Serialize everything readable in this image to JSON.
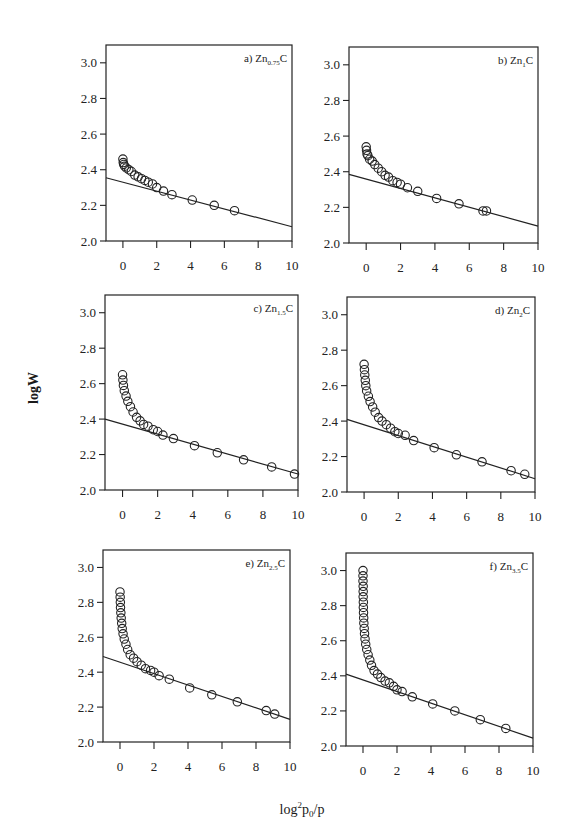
{
  "figure": {
    "ylabel": "logW",
    "xlabel_parts": {
      "base": "log",
      "sup": "2",
      "p": "p",
      "sub": "0",
      "tail": "/p"
    }
  },
  "chart_data": [
    {
      "type": "scatter",
      "id": "a",
      "title": "a) Zn0.75C",
      "label_prefix": "a) Zn",
      "label_sub": "0.75",
      "label_suffix": "C",
      "xlabel": "log²p0/p",
      "ylabel": "logW",
      "xlim": [
        -1,
        10
      ],
      "ylim": [
        2.0,
        3.1
      ],
      "xticks": [
        0,
        2,
        4,
        6,
        8,
        10
      ],
      "yticks": [
        2.0,
        2.2,
        2.4,
        2.6,
        2.8,
        3.0
      ],
      "grid": false,
      "box": {
        "x": 106,
        "y": 45,
        "w": 186,
        "h": 196
      },
      "points": [
        [
          0.0,
          2.46
        ],
        [
          0.02,
          2.44
        ],
        [
          0.05,
          2.43
        ],
        [
          0.1,
          2.42
        ],
        [
          0.2,
          2.41
        ],
        [
          0.35,
          2.4
        ],
        [
          0.5,
          2.39
        ],
        [
          0.7,
          2.37
        ],
        [
          0.9,
          2.36
        ],
        [
          1.1,
          2.35
        ],
        [
          1.3,
          2.34
        ],
        [
          1.5,
          2.33
        ],
        [
          1.75,
          2.32
        ],
        [
          2.0,
          2.3
        ],
        [
          2.4,
          2.28
        ],
        [
          2.9,
          2.26
        ],
        [
          4.1,
          2.23
        ],
        [
          5.4,
          2.2
        ],
        [
          6.6,
          2.17
        ]
      ],
      "fit_line": {
        "x": [
          -1,
          10
        ],
        "y": [
          2.355,
          2.08
        ]
      }
    },
    {
      "type": "scatter",
      "id": "b",
      "title": "b) Zn1C",
      "label_prefix": "b) Zn",
      "label_sub": "1",
      "label_suffix": "C",
      "xlabel": "log²p0/p",
      "ylabel": "logW",
      "xlim": [
        -1,
        10
      ],
      "ylim": [
        2.0,
        3.1
      ],
      "xticks": [
        0,
        2,
        4,
        6,
        8,
        10
      ],
      "yticks": [
        2.0,
        2.2,
        2.4,
        2.6,
        2.8,
        3.0
      ],
      "grid": false,
      "box": {
        "x": 349,
        "y": 47,
        "w": 189,
        "h": 196
      },
      "points": [
        [
          0.0,
          2.54
        ],
        [
          0.02,
          2.52
        ],
        [
          0.05,
          2.5
        ],
        [
          0.1,
          2.49
        ],
        [
          0.2,
          2.47
        ],
        [
          0.35,
          2.46
        ],
        [
          0.5,
          2.44
        ],
        [
          0.7,
          2.42
        ],
        [
          0.9,
          2.4
        ],
        [
          1.1,
          2.38
        ],
        [
          1.3,
          2.37
        ],
        [
          1.55,
          2.35
        ],
        [
          1.8,
          2.34
        ],
        [
          2.0,
          2.33
        ],
        [
          2.4,
          2.31
        ],
        [
          3.0,
          2.29
        ],
        [
          4.1,
          2.25
        ],
        [
          5.4,
          2.22
        ],
        [
          6.8,
          2.18
        ],
        [
          7.0,
          2.18
        ]
      ],
      "fit_line": {
        "x": [
          -1,
          10
        ],
        "y": [
          2.385,
          2.095
        ]
      }
    },
    {
      "type": "scatter",
      "id": "c",
      "title": "c) Zn1.5C",
      "label_prefix": "c) Zn",
      "label_sub": "1.5",
      "label_suffix": "C",
      "xlabel": "log²p0/p",
      "ylabel": "logW",
      "xlim": [
        -1,
        10
      ],
      "ylim": [
        2.0,
        3.1
      ],
      "xticks": [
        0,
        2,
        4,
        6,
        8,
        10
      ],
      "yticks": [
        2.0,
        2.2,
        2.4,
        2.6,
        2.8,
        3.0
      ],
      "grid": false,
      "box": {
        "x": 105,
        "y": 295,
        "w": 193,
        "h": 195
      },
      "points": [
        [
          0.0,
          2.65
        ],
        [
          0.02,
          2.62
        ],
        [
          0.05,
          2.59
        ],
        [
          0.1,
          2.56
        ],
        [
          0.2,
          2.53
        ],
        [
          0.3,
          2.5
        ],
        [
          0.45,
          2.47
        ],
        [
          0.6,
          2.44
        ],
        [
          0.8,
          2.41
        ],
        [
          1.0,
          2.39
        ],
        [
          1.2,
          2.37
        ],
        [
          1.45,
          2.36
        ],
        [
          1.75,
          2.34
        ],
        [
          2.0,
          2.33
        ],
        [
          2.3,
          2.31
        ],
        [
          2.9,
          2.29
        ],
        [
          4.1,
          2.25
        ],
        [
          5.4,
          2.21
        ],
        [
          6.9,
          2.17
        ],
        [
          8.5,
          2.13
        ],
        [
          9.8,
          2.09
        ]
      ],
      "fit_line": {
        "x": [
          -1,
          10
        ],
        "y": [
          2.4,
          2.09
        ]
      }
    },
    {
      "type": "scatter",
      "id": "d",
      "title": "d) Zn2C",
      "label_prefix": "d) Zn",
      "label_sub": "2",
      "label_suffix": "C",
      "xlabel": "log²p0/p",
      "ylabel": "logW",
      "xlim": [
        -1,
        10
      ],
      "ylim": [
        2.0,
        3.1
      ],
      "xticks": [
        0,
        2,
        4,
        6,
        8,
        10
      ],
      "yticks": [
        2.0,
        2.2,
        2.4,
        2.6,
        2.8,
        3.0
      ],
      "grid": false,
      "box": {
        "x": 347,
        "y": 297,
        "w": 188,
        "h": 195
      },
      "points": [
        [
          0.0,
          2.72
        ],
        [
          0.02,
          2.69
        ],
        [
          0.04,
          2.66
        ],
        [
          0.07,
          2.63
        ],
        [
          0.1,
          2.6
        ],
        [
          0.15,
          2.57
        ],
        [
          0.25,
          2.54
        ],
        [
          0.35,
          2.51
        ],
        [
          0.5,
          2.48
        ],
        [
          0.65,
          2.45
        ],
        [
          0.85,
          2.42
        ],
        [
          1.05,
          2.4
        ],
        [
          1.3,
          2.38
        ],
        [
          1.55,
          2.36
        ],
        [
          1.8,
          2.34
        ],
        [
          2.0,
          2.33
        ],
        [
          2.4,
          2.32
        ],
        [
          2.9,
          2.29
        ],
        [
          4.1,
          2.25
        ],
        [
          5.4,
          2.21
        ],
        [
          6.9,
          2.17
        ],
        [
          8.6,
          2.12
        ],
        [
          9.4,
          2.1
        ]
      ],
      "fit_line": {
        "x": [
          -1,
          10
        ],
        "y": [
          2.41,
          2.075
        ]
      }
    },
    {
      "type": "scatter",
      "id": "e",
      "title": "e) Zn2.5C",
      "label_prefix": "e) Zn",
      "label_sub": "2.5",
      "label_suffix": "C",
      "xlabel": "log²p0/p",
      "ylabel": "logW",
      "xlim": [
        -1,
        10
      ],
      "ylim": [
        2.0,
        3.1
      ],
      "xticks": [
        0,
        2,
        4,
        6,
        8,
        10
      ],
      "yticks": [
        2.0,
        2.2,
        2.4,
        2.6,
        2.8,
        3.0
      ],
      "grid": false,
      "box": {
        "x": 103,
        "y": 550,
        "w": 187,
        "h": 192
      },
      "points": [
        [
          0.0,
          2.86
        ],
        [
          0.01,
          2.83
        ],
        [
          0.02,
          2.8
        ],
        [
          0.03,
          2.77
        ],
        [
          0.05,
          2.74
        ],
        [
          0.07,
          2.71
        ],
        [
          0.1,
          2.68
        ],
        [
          0.13,
          2.65
        ],
        [
          0.18,
          2.62
        ],
        [
          0.25,
          2.59
        ],
        [
          0.35,
          2.56
        ],
        [
          0.45,
          2.53
        ],
        [
          0.6,
          2.5
        ],
        [
          0.8,
          2.48
        ],
        [
          1.0,
          2.46
        ],
        [
          1.25,
          2.44
        ],
        [
          1.5,
          2.42
        ],
        [
          1.8,
          2.41
        ],
        [
          2.0,
          2.4
        ],
        [
          2.3,
          2.38
        ],
        [
          2.9,
          2.36
        ],
        [
          4.1,
          2.31
        ],
        [
          5.4,
          2.27
        ],
        [
          6.9,
          2.23
        ],
        [
          8.6,
          2.18
        ],
        [
          9.1,
          2.16
        ]
      ],
      "fit_line": {
        "x": [
          -1,
          10
        ],
        "y": [
          2.49,
          2.13
        ]
      }
    },
    {
      "type": "scatter",
      "id": "f",
      "title": "f) Zn3.5C",
      "label_prefix": "f) Zn",
      "label_sub": "3.5",
      "label_suffix": "C",
      "xlabel": "log²p0/p",
      "ylabel": "logW",
      "xlim": [
        -1,
        10
      ],
      "ylim": [
        2.0,
        3.1
      ],
      "xticks": [
        0,
        2,
        4,
        6,
        8,
        10
      ],
      "yticks": [
        2.0,
        2.2,
        2.4,
        2.6,
        2.8,
        3.0
      ],
      "grid": false,
      "box": {
        "x": 346,
        "y": 553,
        "w": 187,
        "h": 193
      },
      "points": [
        [
          0.0,
          3.0
        ],
        [
          0.0,
          2.97
        ],
        [
          0.0,
          2.94
        ],
        [
          0.01,
          2.91
        ],
        [
          0.01,
          2.88
        ],
        [
          0.01,
          2.85
        ],
        [
          0.02,
          2.82
        ],
        [
          0.02,
          2.79
        ],
        [
          0.03,
          2.76
        ],
        [
          0.04,
          2.73
        ],
        [
          0.05,
          2.7
        ],
        [
          0.07,
          2.67
        ],
        [
          0.09,
          2.64
        ],
        [
          0.12,
          2.61
        ],
        [
          0.16,
          2.58
        ],
        [
          0.22,
          2.55
        ],
        [
          0.3,
          2.52
        ],
        [
          0.4,
          2.49
        ],
        [
          0.5,
          2.46
        ],
        [
          0.65,
          2.43
        ],
        [
          0.85,
          2.41
        ],
        [
          1.05,
          2.39
        ],
        [
          1.3,
          2.37
        ],
        [
          1.55,
          2.36
        ],
        [
          1.8,
          2.34
        ],
        [
          2.0,
          2.32
        ],
        [
          2.3,
          2.31
        ],
        [
          2.9,
          2.28
        ],
        [
          4.1,
          2.24
        ],
        [
          5.4,
          2.2
        ],
        [
          6.9,
          2.15
        ],
        [
          8.4,
          2.1
        ]
      ],
      "fit_line": {
        "x": [
          -1,
          10
        ],
        "y": [
          2.41,
          2.045
        ]
      }
    }
  ]
}
